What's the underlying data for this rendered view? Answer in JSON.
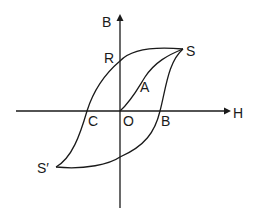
{
  "diagram": {
    "type": "hysteresis-loop",
    "axes": {
      "x_label": "H",
      "y_label": "B"
    },
    "points": {
      "origin": "O",
      "saturation_positive": "S",
      "saturation_negative": "S′",
      "retentivity": "R",
      "coercivity": "C",
      "initial_curve_point": "A",
      "positive_intercept": "B"
    },
    "colors": {
      "line": "#1a1a1a",
      "background": "#ffffff"
    }
  }
}
